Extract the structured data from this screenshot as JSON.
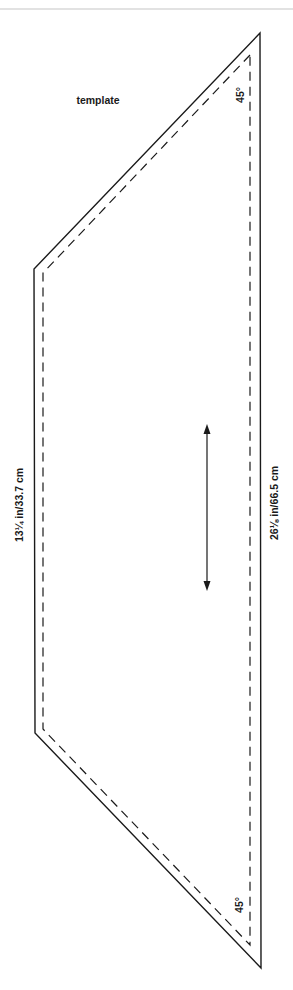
{
  "diagram": {
    "title": "template",
    "labels": {
      "short_side": "13¼ in/33.7 cm",
      "long_side": "26⅛ in/66.5 cm",
      "angle_top": "45°",
      "angle_bottom": "45°"
    },
    "shape": {
      "type": "trapezoid",
      "outer": [
        [
          260,
          33
        ],
        [
          34,
          269
        ],
        [
          35,
          733
        ],
        [
          261,
          968
        ]
      ],
      "inner_dashed": [
        [
          250,
          55
        ],
        [
          43,
          273
        ],
        [
          43,
          729
        ],
        [
          250,
          945
        ]
      ]
    },
    "grainline_arrow": {
      "x": 207,
      "y1": 425,
      "y2": 590
    },
    "colors": {
      "line": "#1a1a1a",
      "topbar": "#e2e2e2"
    }
  }
}
